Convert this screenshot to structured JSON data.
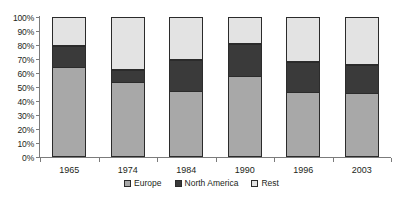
{
  "chart_data": {
    "type": "bar",
    "subtype": "stacked-percent-column",
    "title": "",
    "xlabel": "",
    "ylabel": "",
    "ylim": [
      0,
      100
    ],
    "ytick_labels": [
      "100%",
      "90%",
      "80%",
      "70%",
      "60%",
      "50%",
      "40%",
      "30%",
      "20%",
      "10%",
      "0%"
    ],
    "ytick_values": [
      100,
      90,
      80,
      70,
      60,
      50,
      40,
      30,
      20,
      10,
      0
    ],
    "grid": false,
    "legend_position": "bottom-center",
    "categories": [
      "1965",
      "1974",
      "1984",
      "1990",
      "1996",
      "2003"
    ],
    "series": [
      {
        "name": "Europe",
        "color": "#a8a8a8",
        "values": [
          64,
          53.5,
          47,
          58,
          46.5,
          46
        ]
      },
      {
        "name": "North America",
        "color": "#3a3a3a",
        "values": [
          15,
          8.5,
          22,
          23,
          21.5,
          19.5
        ]
      },
      {
        "name": "Rest",
        "color": "#e3e3e3",
        "values": [
          21,
          38,
          31,
          19,
          32,
          34.5
        ]
      }
    ]
  },
  "legend": {
    "items": [
      {
        "label": "Europe",
        "color": "#a8a8a8"
      },
      {
        "label": "North America",
        "color": "#3a3a3a"
      },
      {
        "label": "Rest",
        "color": "#e3e3e3"
      }
    ]
  },
  "colors": {
    "europe": "#a8a8a8",
    "north_america": "#3a3a3a",
    "rest": "#e3e3e3",
    "axis": "#7b7b7b",
    "outline": "#2b2b2b",
    "text": "#231f20",
    "background": "#ffffff"
  }
}
